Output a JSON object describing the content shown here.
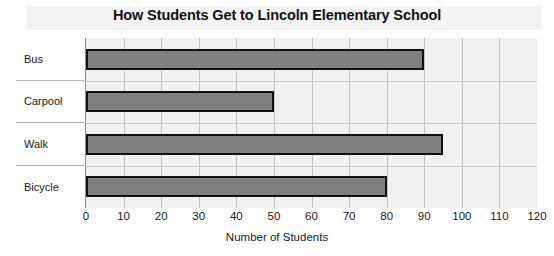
{
  "chart_data": {
    "type": "bar",
    "orientation": "horizontal",
    "title": "How Students Get to Lincoln Elementary School",
    "xlabel": "Number of Students",
    "ylabel": "",
    "categories": [
      "Bus",
      "Carpool",
      "Walk",
      "Bicycle"
    ],
    "values": [
      90,
      50,
      95,
      80
    ],
    "xlim": [
      0,
      120
    ],
    "xticks": [
      0,
      10,
      20,
      30,
      40,
      50,
      60,
      70,
      80,
      90,
      100,
      110,
      120
    ],
    "xtick_labels": [
      "0",
      "10",
      "20",
      "30",
      "40",
      "50",
      "60",
      "70",
      "80",
      "90",
      "100",
      "110",
      "120"
    ],
    "grid": true,
    "legend": false,
    "bar_color": "#808080",
    "bar_border_color": "#111111",
    "plot_background": "#f1f1f1",
    "gridline_color": "#c2c2c2",
    "frame_color": "#8e8e8e",
    "text_color": "#1a1a1a"
  }
}
